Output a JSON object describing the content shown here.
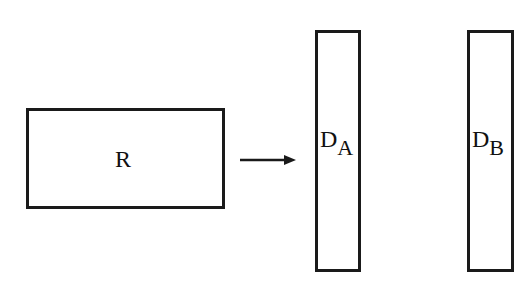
{
  "diagram": {
    "nodes": [
      {
        "id": "R",
        "label": "R"
      },
      {
        "id": "DA",
        "label": "D",
        "subscript": "A"
      },
      {
        "id": "DB",
        "label": "D",
        "subscript": "B"
      }
    ],
    "edges": [
      {
        "from": "R",
        "to": "DA"
      }
    ],
    "colors": {
      "stroke": "#1a1a1a",
      "background": "#ffffff"
    }
  }
}
